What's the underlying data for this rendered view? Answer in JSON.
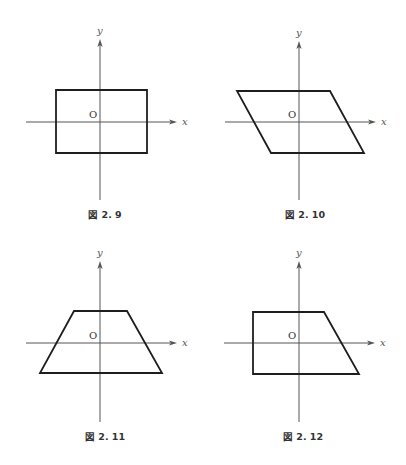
{
  "figures": [
    {
      "caption": "図 2. 9",
      "shape": "rectangle",
      "origin_label": "O",
      "x_label": "x",
      "y_label": "y",
      "axes": {
        "cx": 100,
        "cy": 122,
        "x_from": 26,
        "x_to": 177,
        "y_from": 39,
        "y_to": 200
      },
      "polygon": [
        [
          56,
          90
        ],
        [
          147,
          90
        ],
        [
          147,
          153
        ],
        [
          56,
          153
        ]
      ],
      "caption_pos": [
        105,
        218
      ]
    },
    {
      "caption": "図 2. 10",
      "shape": "parallelogram",
      "origin_label": "O",
      "x_label": "x",
      "y_label": "y",
      "axes": {
        "cx": 299,
        "cy": 122,
        "x_from": 225,
        "x_to": 376,
        "y_from": 41,
        "y_to": 200
      },
      "polygon": [
        [
          237,
          91
        ],
        [
          330,
          91
        ],
        [
          364,
          153
        ],
        [
          271,
          153
        ]
      ],
      "caption_pos": [
        305,
        218
      ]
    },
    {
      "caption": "図 2. 11",
      "shape": "isosceles-trapezoid",
      "origin_label": "O",
      "x_label": "x",
      "y_label": "y",
      "axes": {
        "cx": 100,
        "cy": 343,
        "x_from": 26,
        "x_to": 177,
        "y_from": 261,
        "y_to": 422
      },
      "polygon": [
        [
          74,
          311
        ],
        [
          127,
          311
        ],
        [
          162,
          373
        ],
        [
          40,
          373
        ]
      ],
      "caption_pos": [
        105,
        440
      ]
    },
    {
      "caption": "図 2. 12",
      "shape": "right-trapezoid",
      "origin_label": "O",
      "x_label": "x",
      "y_label": "y",
      "axes": {
        "cx": 299,
        "cy": 343,
        "x_from": 224,
        "x_to": 375,
        "y_from": 261,
        "y_to": 422
      },
      "polygon": [
        [
          253,
          312
        ],
        [
          324,
          312
        ],
        [
          359,
          374
        ],
        [
          253,
          374
        ]
      ],
      "caption_pos": [
        303,
        440
      ]
    }
  ],
  "colors": {
    "axis": "#555555",
    "shape": "#1e1e1e",
    "background": "#ffffff"
  }
}
